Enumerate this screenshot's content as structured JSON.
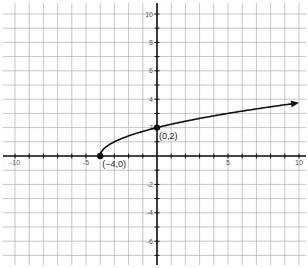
{
  "chart_data": {
    "type": "line",
    "title": "",
    "xlabel": "",
    "ylabel": "",
    "function": "y = sqrt(x + 4)",
    "xlim": [
      -10.5,
      10.5
    ],
    "ylim": [
      -7.5,
      10.5
    ],
    "grid": true,
    "x_ticks_labeled": [
      -10,
      -5,
      5,
      10
    ],
    "y_ticks_labeled": [
      10,
      8,
      6,
      4,
      2,
      -2,
      -4,
      -6
    ],
    "x_tick_labels": [
      "-10",
      "-5",
      "5",
      "10"
    ],
    "y_tick_labels": [
      "10",
      "8",
      "6",
      "4",
      "2",
      "-2",
      "-4",
      "-6"
    ],
    "series": [
      {
        "name": "sqrt(x+4)",
        "domain": [
          -4,
          10
        ],
        "x": [
          -4,
          -3,
          -2,
          -1,
          0,
          1,
          2,
          3,
          4,
          5,
          6,
          7,
          8,
          9,
          10
        ],
        "values": [
          0,
          1,
          1.414,
          1.732,
          2,
          2.236,
          2.449,
          2.646,
          2.828,
          3,
          3.162,
          3.317,
          3.464,
          3.606,
          3.742
        ],
        "arrow_end": true
      }
    ],
    "annotations": [
      {
        "x": -4,
        "y": 0,
        "label": "(−4,0)"
      },
      {
        "x": 0,
        "y": 2,
        "label": "(0,2)"
      }
    ]
  },
  "colors": {
    "grid": "#b8b8b8",
    "axis": "#111111",
    "curve": "#111111",
    "label": "#555555"
  }
}
